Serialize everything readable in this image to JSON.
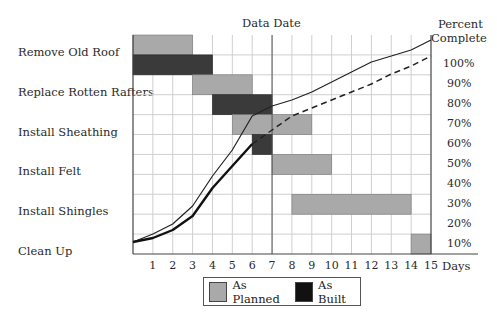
{
  "chart_data": {
    "type": "bar",
    "subtype": "gantt-with-s-curve",
    "title": "",
    "xlabel": "Days",
    "y2label": "Percent Complete",
    "annotation": "Data Date",
    "data_date_day": 7,
    "x_ticks": [
      "1",
      "2",
      "3",
      "4",
      "5",
      "6",
      "7",
      "8",
      "9",
      "10",
      "11",
      "12",
      "13",
      "14",
      "15"
    ],
    "xlim": [
      0,
      15
    ],
    "pct_ticks": [
      "10%",
      "20%",
      "30%",
      "40%",
      "50%",
      "60%",
      "70%",
      "80%",
      "90%",
      "100%"
    ],
    "grid": true,
    "tasks": [
      {
        "name": "Remove Old Roof",
        "planned": [
          0,
          3
        ],
        "built": [
          0,
          4
        ]
      },
      {
        "name": "Replace Rotten Rafters",
        "planned": [
          3,
          6
        ],
        "built": [
          4,
          7
        ]
      },
      {
        "name": "Install Sheathing",
        "planned": [
          5,
          9
        ],
        "built": [
          6,
          7
        ]
      },
      {
        "name": "Install Felt",
        "planned": [
          7,
          10
        ],
        "built": null
      },
      {
        "name": "Install Shingles",
        "planned": [
          8,
          14
        ],
        "built": null
      },
      {
        "name": "Clean Up",
        "planned": [
          14,
          15
        ],
        "built": null
      }
    ],
    "series": [
      {
        "name": "Planned percent complete",
        "style": "thin solid",
        "x": [
          0,
          1,
          2,
          3,
          4,
          5,
          6,
          7,
          8,
          9,
          10,
          11,
          12,
          13,
          14,
          15
        ],
        "values": [
          11,
          15,
          20,
          29,
          44,
          57,
          74,
          79,
          82,
          86,
          91,
          96,
          101,
          104,
          107,
          112
        ]
      },
      {
        "name": "Actual percent complete",
        "style": "thick solid",
        "x": [
          0,
          1,
          2,
          3,
          4,
          5,
          6
        ],
        "values": [
          11,
          13,
          17,
          24,
          38,
          49,
          60
        ]
      },
      {
        "name": "Projected percent complete",
        "style": "dashed",
        "x": [
          6,
          7,
          8,
          9,
          10,
          11,
          12,
          13,
          14,
          15
        ],
        "values": [
          60,
          67,
          74,
          78,
          82,
          86,
          90,
          95,
          99,
          104
        ]
      }
    ],
    "legend": [
      "As Planned",
      "As Built"
    ],
    "legend_position": "bottom"
  },
  "labels": {
    "data_date": "Data Date",
    "percent_line1": "Percent",
    "percent_line2": "Complete",
    "days": "Days",
    "legend_planned": "As Planned",
    "legend_built": "As Built"
  },
  "colors": {
    "planned": "#a9a9a9",
    "built": "#3a3a3a",
    "grid": "#cfcfcf",
    "axis": "#444444"
  }
}
